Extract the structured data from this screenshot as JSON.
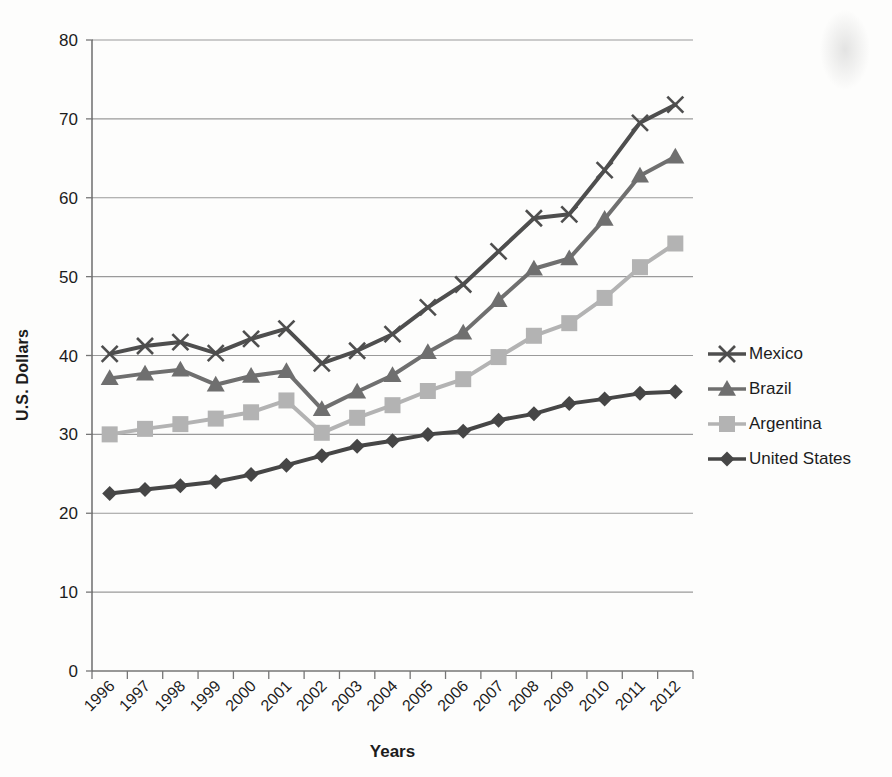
{
  "page": {
    "background": "#fdfdfc"
  },
  "axis_titles": {
    "y": "U.S. Dollars",
    "x": "Years"
  },
  "colors": {
    "gridline": "#9a9a9a",
    "axis": "#767676",
    "tick": "#767676",
    "text": "#1c1c1c",
    "background": "#fdfdfc"
  },
  "chart_data": {
    "type": "line",
    "title": "",
    "xlabel": "Years",
    "ylabel": "U.S. Dollars",
    "ylim": [
      0,
      80
    ],
    "yticks": [
      0,
      10,
      20,
      30,
      40,
      50,
      60,
      70,
      80
    ],
    "grid": true,
    "legend_position": "right",
    "categories": [
      "1996",
      "1997",
      "1998",
      "1999",
      "2000",
      "2001",
      "2002",
      "2003",
      "2004",
      "2005",
      "2006",
      "2007",
      "2008",
      "2009",
      "2010",
      "2011",
      "2012"
    ],
    "series": [
      {
        "name": "Mexico",
        "marker": "x-cross",
        "color": "#4e4e4e",
        "values": [
          40.2,
          41.2,
          41.7,
          40.3,
          42.1,
          43.4,
          39.0,
          40.6,
          42.7,
          46.1,
          49.0,
          53.2,
          57.4,
          57.9,
          63.5,
          69.5,
          71.8
        ]
      },
      {
        "name": "Brazil",
        "marker": "triangle",
        "color": "#6f6f6f",
        "values": [
          37.1,
          37.7,
          38.2,
          36.3,
          37.4,
          38.0,
          33.2,
          35.4,
          37.5,
          40.4,
          42.9,
          47.0,
          51.0,
          52.3,
          57.3,
          62.8,
          65.2
        ]
      },
      {
        "name": "Argentina",
        "marker": "square",
        "color": "#b3b3b3",
        "values": [
          30.0,
          30.7,
          31.3,
          32.0,
          32.8,
          34.3,
          30.2,
          32.1,
          33.7,
          35.5,
          37.0,
          39.8,
          42.5,
          44.1,
          47.3,
          51.2,
          54.2
        ]
      },
      {
        "name": "United States",
        "marker": "diamond",
        "color": "#464646",
        "values": [
          22.5,
          23.0,
          23.5,
          24.0,
          24.9,
          26.1,
          27.3,
          28.5,
          29.2,
          30.0,
          30.4,
          31.8,
          32.6,
          33.9,
          34.5,
          35.2,
          35.4
        ]
      }
    ]
  }
}
